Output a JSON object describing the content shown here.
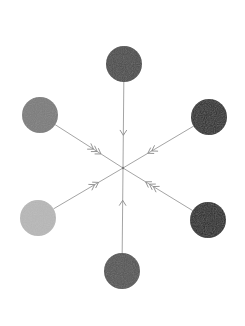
{
  "diagram": {
    "type": "hexagonal-hub-spoke",
    "center": {
      "x": 123,
      "y": 168
    },
    "line_color": "#9a9a9a",
    "arrow_color": "#8a8a8a",
    "nodes": [
      {
        "id": "top",
        "x": 124,
        "y": 64,
        "r": 18,
        "fill": "#4b4b4b",
        "chevrons": 1
      },
      {
        "id": "upper-right",
        "x": 209,
        "y": 117,
        "r": 18,
        "fill": "#2f2f2f",
        "chevrons": 2
      },
      {
        "id": "lower-right",
        "x": 208,
        "y": 220,
        "r": 18,
        "fill": "#2c2c2c",
        "chevrons": 3
      },
      {
        "id": "bottom",
        "x": 122,
        "y": 271,
        "r": 18,
        "fill": "#545454",
        "chevrons": 1
      },
      {
        "id": "lower-left",
        "x": 38,
        "y": 218,
        "r": 18,
        "fill": "#b8b8b8",
        "chevrons": 2
      },
      {
        "id": "upper-left",
        "x": 40,
        "y": 115,
        "r": 18,
        "fill": "#7b7b7b",
        "chevrons": 3
      }
    ]
  }
}
